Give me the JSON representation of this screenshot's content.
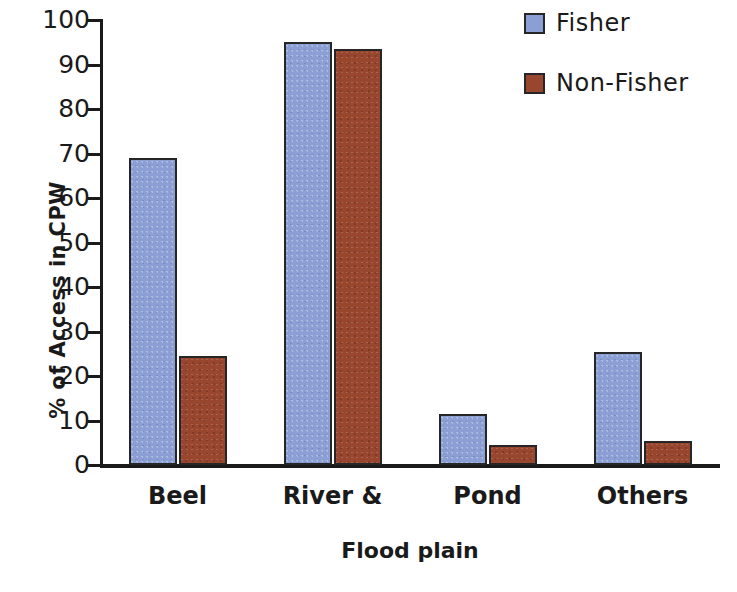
{
  "chart_data": {
    "type": "bar",
    "title": "",
    "xlabel": "Flood plain",
    "ylabel": "% of Access in CPW",
    "categories": [
      "Beel",
      "River &",
      "Pond",
      "Others"
    ],
    "series": [
      {
        "name": "Fisher",
        "color": "#8c9fd5",
        "values": [
          69,
          95,
          11.5,
          25.3
        ]
      },
      {
        "name": "Non-Fisher",
        "color": "#99462f",
        "values": [
          24.5,
          93.5,
          4.5,
          5.5
        ]
      }
    ],
    "ylim": [
      0,
      100
    ],
    "ytick_labels": [
      "100",
      "90",
      "80",
      "70",
      "60",
      "50",
      "40",
      "30",
      "20",
      "10",
      "0"
    ],
    "ytick_values": [
      100,
      90,
      80,
      70,
      60,
      50,
      40,
      30,
      20,
      10,
      0
    ],
    "grid": false,
    "legend_position": "top-right"
  }
}
